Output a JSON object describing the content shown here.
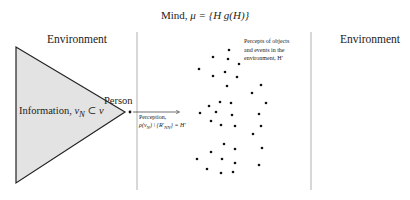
{
  "title": {
    "prefix": "Mind, ",
    "mu": "μ",
    "formula": " = {H   g(H)}"
  },
  "environment_left": "Environment",
  "environment_right": "Environment",
  "person_label": "Person",
  "information_label": {
    "text": "Information, ",
    "math": "v",
    "sub": "N",
    "rest": " ⊂ v"
  },
  "perception_label": {
    "line1": "Perception,",
    "line2": "ρ(v",
    "line2_sub": "N",
    "line2_rest": ") \\ {R′",
    "line2_sub2": "NN",
    "line2_end": "} = H′"
  },
  "percepts_label": {
    "line1": "Percepts of objects",
    "line2": "and events in the",
    "line3": "environment, H′"
  },
  "colors": {
    "triangle_fill": "#e3e3e3",
    "triangle_stroke": "#222222",
    "divider": "#b0b0b0",
    "dot": "#111111"
  },
  "diagram": {
    "triangle": [
      [
        16,
        47
      ],
      [
        16,
        183
      ],
      [
        125,
        112
      ]
    ],
    "person_dot": [
      130,
      112
    ],
    "arrow": {
      "x1": 133,
      "y1": 112,
      "x2": 179,
      "y2": 112
    },
    "dividers": [
      {
        "x": 137,
        "y1": 32,
        "y2": 190
      },
      {
        "x": 311,
        "y1": 32,
        "y2": 190
      }
    ],
    "percept_dots": [
      [
        229,
        50
      ],
      [
        213,
        57
      ],
      [
        228,
        59
      ],
      [
        239,
        64
      ],
      [
        199,
        69
      ],
      [
        225,
        72
      ],
      [
        213,
        76
      ],
      [
        237,
        77
      ],
      [
        227,
        86
      ],
      [
        261,
        85
      ],
      [
        252,
        93
      ],
      [
        220,
        102
      ],
      [
        231,
        103
      ],
      [
        209,
        106
      ],
      [
        266,
        103
      ],
      [
        200,
        113
      ],
      [
        216,
        112
      ],
      [
        232,
        115
      ],
      [
        259,
        114
      ],
      [
        211,
        121
      ],
      [
        221,
        125
      ],
      [
        235,
        126
      ],
      [
        261,
        126
      ],
      [
        253,
        134
      ],
      [
        224,
        144
      ],
      [
        235,
        149
      ],
      [
        262,
        148
      ],
      [
        211,
        152
      ],
      [
        197,
        159
      ],
      [
        222,
        159
      ],
      [
        235,
        163
      ],
      [
        259,
        165
      ],
      [
        207,
        169
      ],
      [
        221,
        173
      ],
      [
        233,
        172
      ]
    ]
  }
}
